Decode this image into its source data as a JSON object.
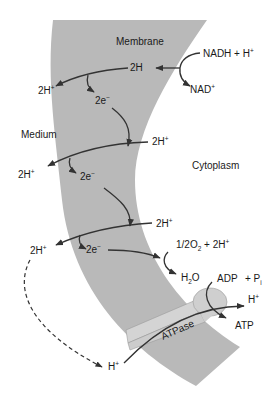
{
  "diagram": {
    "colors": {
      "membrane": "#b9b9b9",
      "atpase": "#d2d2d2",
      "arrow": "#333333",
      "text": "#1a1a1a",
      "background": "#ffffff"
    },
    "regions": {
      "membrane": "Membrane",
      "medium": "Medium",
      "cytoplasm": "Cytoplasm"
    },
    "labels": {
      "nadh": "NADH + H",
      "nadh_sup": "+",
      "nad": "NAD",
      "nad_sup": "+",
      "two_h": "2H",
      "two_h_plus_1": "2H",
      "two_h_plus_1_sup": "+",
      "two_e_1": "2e",
      "two_e_1_sup": "−",
      "two_h_plus_2": "2H",
      "two_h_plus_2_sup": "+",
      "two_h_plus_3": "2H",
      "two_h_plus_3_sup": "+",
      "two_e_2": "2e",
      "two_e_2_sup": "−",
      "two_h_plus_4": "2H",
      "two_h_plus_4_sup": "+",
      "two_h_plus_5": "2H",
      "two_h_plus_5_sup": "+",
      "two_e_3": "2e",
      "two_e_3_sup": "−",
      "half_o2_prefix": "1/2O",
      "half_o2_sub": "2",
      "half_o2_suffix": " + 2H",
      "half_o2_sup": "+",
      "h2o_h": "H",
      "h2o_sub": "2",
      "h2o_o": "O",
      "adp": "ADP",
      "pi": "+ P",
      "pi_sub": "i",
      "h_plus_out": "H",
      "h_plus_out_sup": "+",
      "atp": "ATP",
      "atpase": "ATPase",
      "h_plus_in": "H",
      "h_plus_in_sup": "+"
    }
  }
}
